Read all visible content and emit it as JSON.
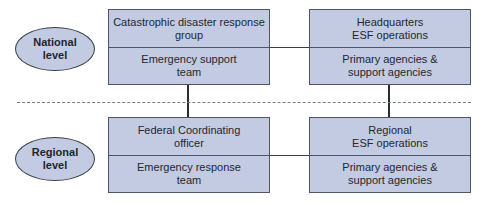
{
  "levels": {
    "national": {
      "label": "National level",
      "line1": "National",
      "line2": "level"
    },
    "regional": {
      "label": "Regional level",
      "line1": "Regional",
      "line2": "level"
    }
  },
  "national": {
    "left_box": {
      "top": "Catastrophic disaster response group",
      "bottom": "Emergency support team"
    },
    "right_box": {
      "top_line1": "Headquarters",
      "top_line2": "ESF operations",
      "bottom": "Primary agencies & support agencies"
    }
  },
  "regional": {
    "left_box": {
      "top": "Federal Coordinating officer",
      "bottom": "Emergency response team"
    },
    "right_box": {
      "top_line1": "Regional",
      "top_line2": "ESF operations",
      "bottom": "Primary agencies & support agencies"
    }
  },
  "colors": {
    "box_fill": "#c2cbe2",
    "border": "#505566",
    "connector": "#2a2c33",
    "divider": "#7a7d88"
  }
}
